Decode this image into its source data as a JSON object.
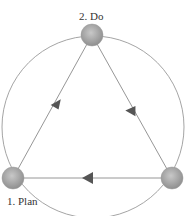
{
  "diagram": {
    "type": "cycle",
    "nodes": [
      {
        "id": "plan",
        "label": "1. Plan",
        "x": 13,
        "y": 178
      },
      {
        "id": "do",
        "label": "2. Do",
        "x": 92,
        "y": 35
      },
      {
        "id": "check",
        "label": "",
        "x": 172,
        "y": 178
      }
    ],
    "edges": [
      {
        "from": "plan",
        "to": "do"
      },
      {
        "from": "do",
        "to": "check"
      },
      {
        "from": "check",
        "to": "plan"
      }
    ],
    "circle": {
      "cx": 93,
      "cy": 127,
      "r": 91
    },
    "colors": {
      "line": "#8a8a8a",
      "node": "#a8a8a8",
      "arrow": "#555555"
    }
  }
}
